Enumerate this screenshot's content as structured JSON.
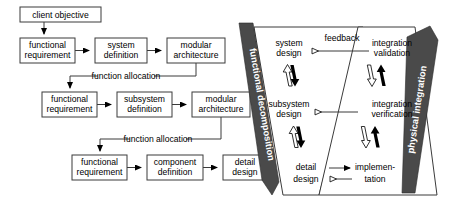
{
  "diagram": {
    "colors": {
      "box_stroke": "#3b3b3b",
      "box_fill": "#ffffff",
      "banner_fill": "#4a4a4a",
      "banner_text": "#ffffff",
      "line": "#3b3b3b",
      "background": "#ffffff"
    }
  },
  "left_flow": {
    "top_box": {
      "label": "client objective"
    },
    "rows": [
      {
        "connector_label": "",
        "boxes": [
          {
            "line1": "functional",
            "line2": "requirement"
          },
          {
            "line1": "system",
            "line2": "definition"
          },
          {
            "line1": "modular",
            "line2": "architecture"
          }
        ]
      },
      {
        "connector_label": "function allocation",
        "boxes": [
          {
            "line1": "functional",
            "line2": "requirement"
          },
          {
            "line1": "subsystem",
            "line2": "definition"
          },
          {
            "line1": "modular",
            "line2": "architecture"
          }
        ]
      },
      {
        "connector_label": "function allocation",
        "boxes": [
          {
            "line1": "functional",
            "line2": "requirement"
          },
          {
            "line1": "component",
            "line2": "definition"
          },
          {
            "line1": "detail",
            "line2": "design"
          }
        ]
      }
    ]
  },
  "v_model": {
    "left_banner": {
      "label": "functional decomposition",
      "direction": "down"
    },
    "right_banner": {
      "label": "physical integration",
      "direction": "up"
    },
    "left_stages": [
      {
        "line1": "system",
        "line2": "design"
      },
      {
        "line1": "subsystem",
        "line2": "design"
      },
      {
        "line1": "detail",
        "line2": "design"
      }
    ],
    "right_stages": [
      {
        "line1": "integration",
        "line2": "validation"
      },
      {
        "line1": "integration",
        "line2": "verification"
      },
      {
        "line1": "implemen-",
        "line2": "tation"
      }
    ],
    "cross_links": [
      {
        "label": "feedback",
        "arrow": "left-hollow"
      },
      {
        "label": "",
        "arrow": "left-hollow"
      },
      {
        "label": "",
        "arrow": "bidirectional"
      }
    ]
  }
}
